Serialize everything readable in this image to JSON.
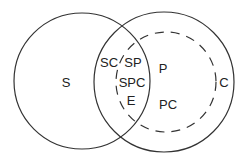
{
  "diagram": {
    "type": "venn",
    "colors": {
      "stroke": "#333333",
      "text": "#222222",
      "background": "#ffffff"
    },
    "circles": [
      {
        "id": "S",
        "style": "solid",
        "cx": 82,
        "cy": 81,
        "r": 68
      },
      {
        "id": "C",
        "style": "solid",
        "cx": 164,
        "cy": 82,
        "r": 70
      },
      {
        "id": "P",
        "style": "dashed",
        "cx": 166,
        "cy": 82,
        "r": 50
      }
    ],
    "labels": {
      "s": "S",
      "sc": "SC",
      "sp": "SP",
      "spc": "SPC",
      "e": "E",
      "p": "P",
      "pc": "PC",
      "c": "C"
    }
  }
}
